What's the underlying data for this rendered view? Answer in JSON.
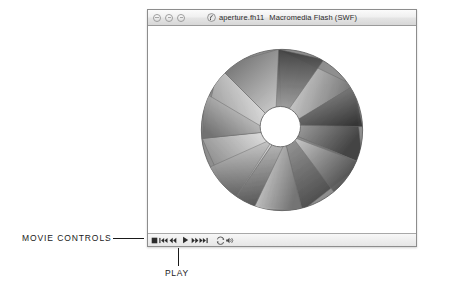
{
  "window": {
    "title_file": "aperture.fh11",
    "title_app": "Macromedia Flash (SWF)",
    "doc_icon": "flash-document-icon",
    "buttons": [
      {
        "name": "close-button",
        "label": "Close"
      },
      {
        "name": "minimize-button",
        "label": "Minimize"
      },
      {
        "name": "zoom-button",
        "label": "Zoom"
      }
    ]
  },
  "movie": {
    "artwork_name": "aperture-iris-diagram",
    "blade_count": 8,
    "center_opening": "white-circle",
    "palette": {
      "blade_light": "#f2f2f2",
      "blade_mid": "#9a9a9a",
      "blade_dark": "#4a4a4a",
      "blade_darkest": "#333333",
      "opening": "#ffffff",
      "outline": "#5a5a5a"
    }
  },
  "controls": {
    "bar_name": "movie-controls-bar",
    "buttons": [
      {
        "name": "stop-button",
        "icon": "stop-icon",
        "label": "Stop"
      },
      {
        "name": "rewind-button",
        "icon": "skip-to-start-icon",
        "label": "Rewind"
      },
      {
        "name": "step-back-button",
        "icon": "step-back-icon",
        "label": "Step Back"
      },
      {
        "name": "play-button",
        "icon": "play-icon",
        "label": "Play"
      },
      {
        "name": "step-forward-button",
        "icon": "step-forward-icon",
        "label": "Step Forward"
      },
      {
        "name": "fast-forward-button",
        "icon": "skip-to-end-icon",
        "label": "Fast Forward"
      },
      {
        "name": "loop-button",
        "icon": "loop-icon",
        "label": "Loop"
      },
      {
        "name": "mute-button",
        "icon": "sound-icon",
        "label": "Sound"
      }
    ]
  },
  "annotations": [
    {
      "name": "annotation-movie-controls",
      "text": "MOVIE CONTROLS"
    },
    {
      "name": "annotation-play",
      "text": "PLAY"
    }
  ]
}
